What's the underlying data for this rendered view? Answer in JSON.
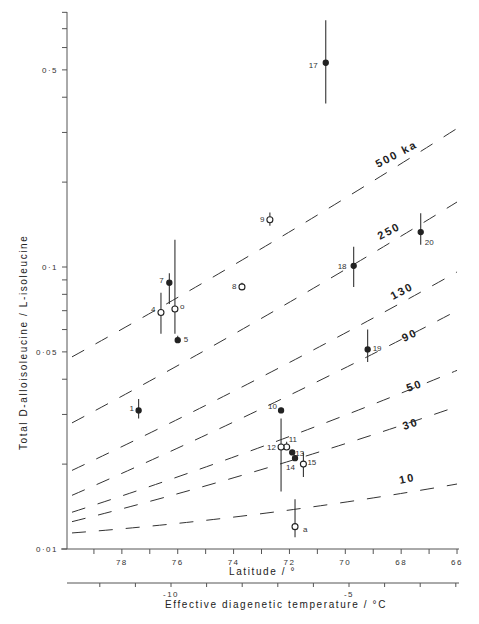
{
  "chart_data": {
    "type": "scatter",
    "title": "",
    "xlabel": "Latitude / °",
    "x2label": "Effective diagenetic temperature / °C",
    "ylabel": "Total D-alloisoleucine / L-isoleucine",
    "yscale": "log",
    "ylim": [
      0.01,
      0.85
    ],
    "xlim": [
      80,
      66
    ],
    "x_ticks": [
      78,
      76,
      74,
      72,
      70,
      68,
      66
    ],
    "x_tick_labels": [
      "78",
      "76",
      "74",
      "72",
      "70",
      "68",
      "66"
    ],
    "x2_ticks": [
      -10,
      -5
    ],
    "x2_tick_labels": [
      "-10",
      "-5"
    ],
    "y_ticks": [
      0.01,
      0.05,
      0.1,
      0.5
    ],
    "y_tick_labels": [
      "0·01",
      "0·05",
      "0·1",
      "0·5"
    ],
    "grid": false,
    "legend": null,
    "points": [
      {
        "label": "1",
        "lat": 77.4,
        "value": 0.031,
        "filled": true,
        "err": [
          0.029,
          0.034
        ]
      },
      {
        "label": "4",
        "lat": 76.6,
        "value": 0.069,
        "filled": false,
        "err": [
          0.058,
          0.081
        ]
      },
      {
        "label": "5",
        "lat": 76.0,
        "value": 0.055,
        "filled": true,
        "err": [
          0.054,
          0.057
        ]
      },
      {
        "label": "6",
        "lat": 76.1,
        "value": 0.071,
        "filled": false,
        "err": [
          0.058,
          0.125
        ]
      },
      {
        "label": "7",
        "lat": 76.3,
        "value": 0.088,
        "filled": true,
        "err": [
          0.074,
          0.095
        ]
      },
      {
        "label": "8",
        "lat": 73.7,
        "value": 0.085,
        "filled": false,
        "err": [
          0.083,
          0.088
        ]
      },
      {
        "label": "9",
        "lat": 72.7,
        "value": 0.147,
        "filled": false,
        "err": [
          0.14,
          0.156
        ]
      },
      {
        "label": "10",
        "lat": 72.3,
        "value": 0.031,
        "filled": true,
        "err": [
          0.031,
          0.031
        ]
      },
      {
        "label": "11",
        "lat": 72.1,
        "value": 0.023,
        "filled": false,
        "err": [
          0.023,
          0.024
        ]
      },
      {
        "label": "12",
        "lat": 72.3,
        "value": 0.023,
        "filled": false,
        "err": [
          0.016,
          0.029
        ]
      },
      {
        "label": "13",
        "lat": 71.9,
        "value": 0.022,
        "filled": true,
        "err": [
          0.022,
          0.022
        ]
      },
      {
        "label": "14",
        "lat": 71.8,
        "value": 0.021,
        "filled": true,
        "err": [
          0.021,
          0.021
        ]
      },
      {
        "label": "15",
        "lat": 71.5,
        "value": 0.02,
        "filled": false,
        "err": [
          0.018,
          0.022
        ]
      },
      {
        "label": "a",
        "lat": 71.8,
        "value": 0.012,
        "filled": false,
        "err": [
          0.011,
          0.015
        ]
      },
      {
        "label": "17",
        "lat": 70.7,
        "value": 0.53,
        "filled": true,
        "err": [
          0.38,
          0.75
        ]
      },
      {
        "label": "18",
        "lat": 69.7,
        "value": 0.101,
        "filled": true,
        "err": [
          0.085,
          0.118
        ]
      },
      {
        "label": "19",
        "lat": 69.2,
        "value": 0.051,
        "filled": true,
        "err": [
          0.046,
          0.06
        ]
      },
      {
        "label": "20",
        "lat": 67.3,
        "value": 0.133,
        "filled": true,
        "err": [
          0.12,
          0.155
        ]
      }
    ],
    "isochrons": [
      {
        "label": "500 ka",
        "start": [
          80,
          0.048
        ],
        "end": [
          66,
          0.31
        ]
      },
      {
        "label": "250",
        "start": [
          80,
          0.028
        ],
        "end": [
          66,
          0.17
        ]
      },
      {
        "label": "130",
        "start": [
          80,
          0.019
        ],
        "end": [
          66,
          0.096
        ]
      },
      {
        "label": "90",
        "start": [
          80,
          0.0155
        ],
        "end": [
          66,
          0.07
        ]
      },
      {
        "label": "50",
        "start": [
          80,
          0.0135
        ],
        "end": [
          66,
          0.043
        ]
      },
      {
        "label": "30",
        "start": [
          80,
          0.0125
        ],
        "end": [
          66,
          0.032
        ]
      },
      {
        "label": "10",
        "start": [
          80,
          0.0114
        ],
        "end": [
          66,
          0.017
        ]
      }
    ]
  },
  "labels": {
    "ylabel": "Total D-alloisoleucine / L-isoleucine",
    "xlabel": "Latitude / °",
    "x2label": "Effective diagenetic temperature / °C"
  }
}
